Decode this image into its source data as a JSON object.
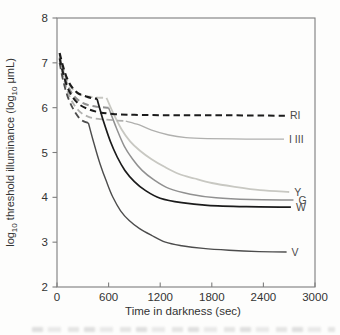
{
  "chart_data": {
    "type": "line",
    "title": "",
    "xlabel": "Time in darkness (sec)",
    "ylabel": "log10 threshold illuminance (log10 μmL)",
    "ylabel_parts": [
      {
        "t": "log"
      },
      {
        "t": "10",
        "sub": true
      },
      {
        "t": " threshold illuminance (log"
      },
      {
        "t": "10",
        "sub": true
      },
      {
        "t": " μmL)"
      }
    ],
    "xlim": [
      0,
      3000
    ],
    "ylim": [
      2,
      8
    ],
    "x_ticks": [
      0,
      600,
      1200,
      1800,
      2400,
      3000
    ],
    "y_ticks": [
      8,
      7,
      6,
      5,
      4,
      3,
      2
    ],
    "grid": false,
    "legend": "curve-end labels",
    "frame_color": "#7d7d7d",
    "tick_text_color": "#333333",
    "label_color": "#4a4a4a",
    "series": [
      {
        "id": "Y",
        "label": "Y",
        "color": "#c8c8c2",
        "segments": [
          {
            "style": "dashed",
            "width": 2.0,
            "points": [
              [
                30,
                7.18
              ],
              [
                70,
                6.88
              ],
              [
                120,
                6.6
              ],
              [
                180,
                6.42
              ],
              [
                260,
                6.3
              ],
              [
                360,
                6.25
              ],
              [
                470,
                6.23
              ],
              [
                575,
                6.22
              ]
            ]
          },
          {
            "style": "solid",
            "width": 1.8,
            "points": [
              [
                575,
                6.22
              ],
              [
                660,
                5.85
              ],
              [
                750,
                5.52
              ],
              [
                850,
                5.25
              ],
              [
                965,
                5.04
              ],
              [
                1100,
                4.85
              ],
              [
                1250,
                4.68
              ],
              [
                1420,
                4.52
              ],
              [
                1600,
                4.42
              ],
              [
                1800,
                4.32
              ],
              [
                2050,
                4.24
              ],
              [
                2360,
                4.16
              ],
              [
                2700,
                4.12
              ]
            ]
          }
        ]
      },
      {
        "id": "I-III",
        "label": "I III",
        "color": "#b0b0ae",
        "segments": [
          {
            "style": "dashed",
            "width": 1.8,
            "points": [
              [
                30,
                7.05
              ],
              [
                70,
                6.72
              ],
              [
                120,
                6.38
              ],
              [
                180,
                6.12
              ],
              [
                260,
                5.92
              ],
              [
                360,
                5.8
              ],
              [
                480,
                5.75
              ],
              [
                650,
                5.72
              ],
              [
                800,
                5.7
              ]
            ]
          },
          {
            "style": "solid",
            "width": 1.3,
            "points": [
              [
                800,
                5.7
              ],
              [
                950,
                5.62
              ],
              [
                1100,
                5.5
              ],
              [
                1300,
                5.39
              ],
              [
                1500,
                5.33
              ],
              [
                1750,
                5.31
              ],
              [
                2200,
                5.3
              ],
              [
                2640,
                5.3
              ]
            ]
          }
        ]
      },
      {
        "id": "G",
        "label": "G",
        "color": "#909090",
        "segments": [
          {
            "style": "dashed",
            "width": 2.0,
            "points": [
              [
                30,
                7.12
              ],
              [
                70,
                6.82
              ],
              [
                120,
                6.52
              ],
              [
                180,
                6.3
              ],
              [
                260,
                6.15
              ],
              [
                360,
                6.06
              ],
              [
                470,
                6.02
              ],
              [
                600,
                6.0
              ]
            ]
          },
          {
            "style": "solid",
            "width": 1.5,
            "points": [
              [
                600,
                6.0
              ],
              [
                690,
                5.55
              ],
              [
                780,
                5.15
              ],
              [
                880,
                4.85
              ],
              [
                990,
                4.6
              ],
              [
                1120,
                4.4
              ],
              [
                1300,
                4.2
              ],
              [
                1550,
                4.07
              ],
              [
                1850,
                3.99
              ],
              [
                2250,
                3.95
              ],
              [
                2750,
                3.94
              ]
            ]
          }
        ]
      },
      {
        "id": "V",
        "label": "V",
        "color": "#4c4c4c",
        "segments": [
          {
            "style": "dashed",
            "width": 1.8,
            "points": [
              [
                30,
                7.0
              ],
              [
                70,
                6.62
              ],
              [
                120,
                6.27
              ],
              [
                180,
                6.0
              ],
              [
                245,
                5.8
              ],
              [
                305,
                5.7
              ],
              [
                365,
                5.66
              ]
            ]
          },
          {
            "style": "solid",
            "width": 1.4,
            "points": [
              [
                365,
                5.66
              ],
              [
                430,
                5.2
              ],
              [
                500,
                4.75
              ],
              [
                575,
                4.35
              ],
              [
                650,
                4.0
              ],
              [
                740,
                3.7
              ],
              [
                840,
                3.48
              ],
              [
                960,
                3.3
              ],
              [
                1100,
                3.15
              ],
              [
                1260,
                3.0
              ],
              [
                1450,
                2.92
              ],
              [
                1700,
                2.86
              ],
              [
                2000,
                2.82
              ],
              [
                2350,
                2.79
              ],
              [
                2670,
                2.78
              ]
            ]
          }
        ]
      },
      {
        "id": "RI",
        "label": "RI",
        "color": "#1b1b1b",
        "segments": [
          {
            "style": "dashed",
            "width": 2.0,
            "points": [
              [
                30,
                7.1
              ],
              [
                70,
                6.78
              ],
              [
                120,
                6.46
              ],
              [
                180,
                6.24
              ],
              [
                260,
                6.07
              ],
              [
                360,
                5.97
              ],
              [
                480,
                5.9
              ],
              [
                650,
                5.86
              ],
              [
                900,
                5.84
              ],
              [
                1400,
                5.83
              ],
              [
                2000,
                5.83
              ],
              [
                2650,
                5.82
              ]
            ]
          }
        ]
      },
      {
        "id": "W",
        "label": "W",
        "color": "#1b1b1b",
        "segments": [
          {
            "style": "dashed",
            "width": 2.2,
            "points": [
              [
                30,
                7.22
              ],
              [
                70,
                6.92
              ],
              [
                120,
                6.64
              ],
              [
                180,
                6.44
              ],
              [
                255,
                6.31
              ],
              [
                340,
                6.25
              ],
              [
                410,
                6.21
              ],
              [
                465,
                6.2
              ]
            ]
          },
          {
            "style": "solid",
            "width": 1.7,
            "points": [
              [
                465,
                6.2
              ],
              [
                540,
                5.7
              ],
              [
                620,
                5.25
              ],
              [
                700,
                4.9
              ],
              [
                790,
                4.6
              ],
              [
                900,
                4.35
              ],
              [
                1030,
                4.15
              ],
              [
                1200,
                3.98
              ],
              [
                1450,
                3.88
              ],
              [
                1750,
                3.82
              ],
              [
                2200,
                3.79
              ],
              [
                2720,
                3.78
              ]
            ]
          }
        ]
      }
    ]
  }
}
